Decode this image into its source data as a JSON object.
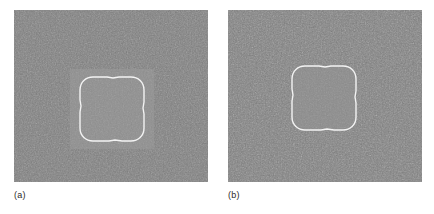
{
  "figure": {
    "background_color": "#ffffff",
    "width": 434,
    "height": 214
  },
  "panels": [
    {
      "id": "a",
      "caption": "(a)",
      "description": "Noisy gray image containing a brighter square region with a white closed contour outlining a rounded square",
      "noise_base_color": "#7d7d7d",
      "region_color": "#8e8e8e",
      "inner_object_color": "#8e8e8e",
      "contour_color": "#f2f2f2",
      "contour_width": 1.4,
      "has_outer_bright_square": true,
      "outer_bright_square": {
        "x": 56,
        "y": 59,
        "width": 84,
        "height": 80
      },
      "contour_box": {
        "x": 66,
        "y": 67,
        "width": 64,
        "height": 64
      }
    },
    {
      "id": "b",
      "caption": "(b)",
      "description": "Noisy gray image with a white closed contour outlining a rounded square region only",
      "noise_base_color": "#7d7d7d",
      "region_color": "#8a8a8a",
      "inner_object_color": "#8a8a8a",
      "contour_color": "#f2f2f2",
      "contour_width": 1.4,
      "has_outer_bright_square": false,
      "outer_bright_square": null,
      "contour_box": {
        "x": 64,
        "y": 56,
        "width": 64,
        "height": 64
      }
    }
  ],
  "captions": {
    "a": "(a)",
    "b": "(b)"
  }
}
